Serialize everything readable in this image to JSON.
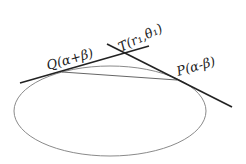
{
  "diagram": {
    "labels": {
      "Q": "Q(α+β)",
      "T": "T(r₁,θ₁)",
      "P": "P(α-β)"
    },
    "colors": {
      "lines": "#222222",
      "ellipse": "#888888",
      "chord": "#666666"
    }
  }
}
